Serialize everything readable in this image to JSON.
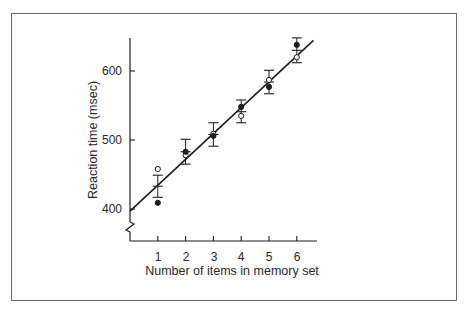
{
  "chart_data": {
    "type": "scatter",
    "title": "",
    "xlabel": "Number of items in memory set",
    "ylabel": "Reaction time (msec)",
    "x": [
      1,
      2,
      3,
      4,
      5,
      6
    ],
    "xlim": [
      0,
      6.75
    ],
    "ylim": [
      400,
      650
    ],
    "y_ticks": [
      400,
      500,
      600
    ],
    "x_ticks": [
      1,
      2,
      3,
      4,
      5,
      6
    ],
    "y_axis_break": true,
    "grid": false,
    "legend": null,
    "series": [
      {
        "name": "Open circles",
        "marker": "open-circle",
        "values": [
          458,
          478,
          509,
          535,
          587,
          620
        ]
      },
      {
        "name": "Filled circles",
        "marker": "filled-circle",
        "values": [
          409,
          483,
          506,
          548,
          577,
          638
        ]
      }
    ],
    "error_bars": {
      "center": [
        433,
        483,
        508,
        541,
        584,
        630
      ],
      "upper": [
        449,
        501,
        525,
        558,
        601,
        648
      ],
      "lower": [
        417,
        465,
        491,
        525,
        567,
        612
      ]
    },
    "fit_line": {
      "intercept": 397,
      "slope": 37.5,
      "x_start": 0,
      "x_end": 6.6
    }
  },
  "axes": {
    "y_tick_labels": [
      "400",
      "500",
      "600"
    ],
    "x_tick_labels": [
      "1",
      "2",
      "3",
      "4",
      "5",
      "6"
    ],
    "xlabel": "Number of items in memory set",
    "ylabel": "Reaction time (msec)"
  },
  "colors": {
    "ink": "#1e1e1e",
    "frame": "#6b6b6b",
    "background": "#ffffff"
  }
}
